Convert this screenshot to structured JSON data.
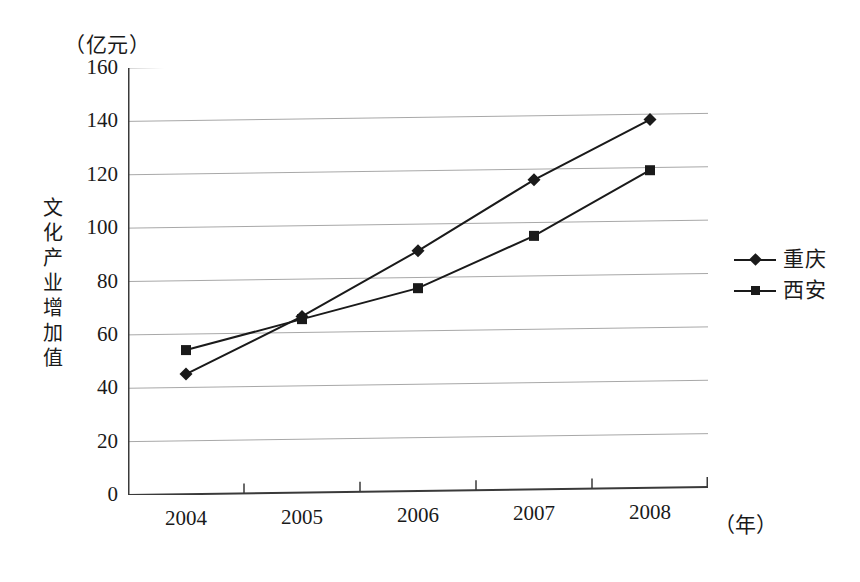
{
  "chart_data": {
    "type": "line",
    "title": "",
    "xlabel": "（年）",
    "ylabel": "文化产业增加值",
    "yunit": "（亿元）",
    "categories": [
      "2004",
      "2005",
      "2006",
      "2007",
      "2008"
    ],
    "ylim": [
      0,
      160
    ],
    "yticks": [
      "0",
      "20",
      "40",
      "60",
      "80",
      "100",
      "120",
      "140",
      "160"
    ],
    "ytick_values": [
      0,
      20,
      40,
      60,
      80,
      100,
      120,
      140,
      160
    ],
    "grid": true,
    "legend_position": "right",
    "series": [
      {
        "name": "重庆",
        "marker": "diamond",
        "color": "#1a1a1a",
        "values": [
          45,
          66,
          90,
          116,
          138
        ]
      },
      {
        "name": "西安",
        "marker": "square",
        "color": "#1a1a1a",
        "values": [
          54,
          65,
          76,
          95,
          119
        ]
      }
    ]
  },
  "axis": {
    "y_title_chars": [
      "文",
      "化",
      "产",
      "业",
      "增",
      "加",
      "值"
    ],
    "y_unit_label": "（亿元）",
    "x_unit_label": "（年）"
  },
  "colors": {
    "ink": "#1a1a1a",
    "gridline": "#a8a8a8",
    "axis": "#3a3a3a",
    "background": "#ffffff"
  }
}
